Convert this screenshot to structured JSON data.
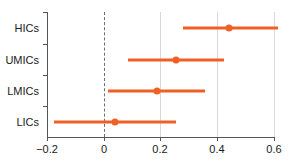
{
  "chart_data": {
    "type": "scatter",
    "subtype": "forest-plot",
    "title": "",
    "xlabel": "",
    "ylabel": "",
    "categories": [
      "HICs",
      "UMICs",
      "LMICs",
      "LICs"
    ],
    "values": [
      0.44,
      0.255,
      0.187,
      0.04
    ],
    "ci_low": [
      0.28,
      0.085,
      0.015,
      -0.175
    ],
    "ci_high": [
      0.615,
      0.425,
      0.355,
      0.255
    ],
    "series": [
      {
        "name": "Effect estimate",
        "points": [
          {
            "category": "HICs",
            "estimate": 0.44,
            "low": 0.28,
            "high": 0.615
          },
          {
            "category": "UMICs",
            "estimate": 0.255,
            "low": 0.085,
            "high": 0.425
          },
          {
            "category": "LMICs",
            "estimate": 0.187,
            "low": 0.015,
            "high": 0.355
          },
          {
            "category": "LICs",
            "estimate": 0.04,
            "low": -0.175,
            "high": 0.255
          }
        ]
      }
    ],
    "xlim": [
      -0.2,
      0.6
    ],
    "xticks": [
      -0.2,
      0,
      0.2,
      0.4,
      0.6
    ],
    "xticklabels": [
      "−0.2",
      "0",
      "0.2",
      "0.4",
      "0.6"
    ],
    "grid": true,
    "gridlines_x": [
      0.2,
      0.4,
      0.6
    ],
    "reference_line": {
      "value": 0,
      "style": "dashed",
      "color": "#6e6e6e"
    },
    "legend": null,
    "colors": {
      "marker": "#ef6024",
      "interval": "#ef6024",
      "grid": "#d9d9d9",
      "axis": "#555555"
    }
  },
  "axis": {
    "x": {
      "ticks": [
        {
          "label": "−0.2",
          "value": -0.2
        },
        {
          "label": "0",
          "value": 0
        },
        {
          "label": "0.2",
          "value": 0.2
        },
        {
          "label": "0.4",
          "value": 0.4
        },
        {
          "label": "0.6",
          "value": 0.6
        }
      ]
    },
    "y": {
      "ticks": [
        {
          "label": "HICs",
          "value": 0
        },
        {
          "label": "UMICs",
          "value": 1
        },
        {
          "label": "LMICs",
          "value": 2
        },
        {
          "label": "LICs",
          "value": 3
        }
      ]
    }
  },
  "caption": {
    "clipped_text": ""
  }
}
